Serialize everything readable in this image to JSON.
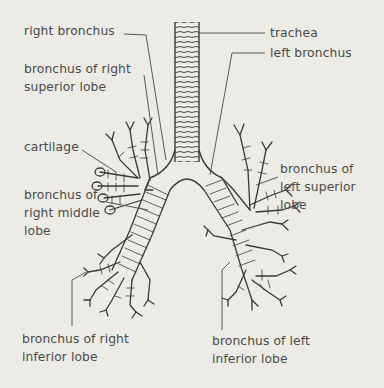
{
  "diagram": {
    "background": "#ecebe6",
    "ink": "#3a3a38",
    "labels": {
      "right_bronchus": [
        "right bronchus"
      ],
      "bronchus_right_superior": [
        "bronchus of right",
        "superior lobe"
      ],
      "cartilage": [
        "cartilage"
      ],
      "bronchus_right_middle": [
        "bronchus of",
        "right middle",
        "lobe"
      ],
      "bronchus_right_inferior": [
        "bronchus of right",
        "inferior lobe"
      ],
      "trachea": [
        "trachea"
      ],
      "left_bronchus": [
        "left bronchus"
      ],
      "bronchus_left_superior": [
        "bronchus of",
        "left superior",
        "lobe"
      ],
      "bronchus_left_inferior": [
        "bronchus of left",
        "inferior lobe"
      ]
    }
  }
}
